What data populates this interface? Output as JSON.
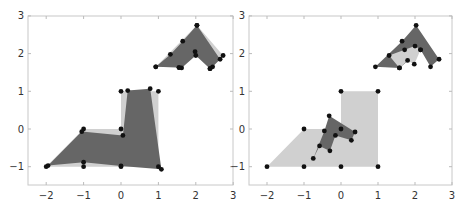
{
  "chart_data": [
    {
      "type": "polygon-scatter",
      "title": "",
      "xlabel": "",
      "ylabel": "",
      "xlim": [
        -2.5,
        3
      ],
      "ylim": [
        -1.5,
        3
      ],
      "xticks": [
        "-2",
        "-1",
        "0",
        "1",
        "2",
        "3"
      ],
      "yticks": [
        "-1",
        "0",
        "1",
        "2",
        "3"
      ],
      "grid": false,
      "series": [
        {
          "name": "original-L-shape",
          "fill": "#d0d0d0",
          "points": [
            [
              -2,
              -1
            ],
            [
              -1,
              0
            ],
            [
              0,
              0
            ],
            [
              0,
              1
            ],
            [
              1,
              1
            ],
            [
              1,
              -1
            ],
            [
              0,
              -1
            ],
            [
              -1,
              -1
            ]
          ]
        },
        {
          "name": "transformed-L-shape",
          "fill": "#666666",
          "points": [
            [
              -1.95,
              -0.97
            ],
            [
              -1.05,
              -0.07
            ],
            [
              0.05,
              -0.17
            ],
            [
              0.18,
              1.02
            ],
            [
              0.78,
              1.07
            ],
            [
              1.08,
              -1.07
            ],
            [
              0.0,
              -0.98
            ],
            [
              -1.0,
              -0.88
            ]
          ]
        },
        {
          "name": "original-chevron",
          "fill": "#d0d0d0",
          "points": [
            [
              0.93,
              1.65
            ],
            [
              2.03,
              2.75
            ],
            [
              2.73,
              1.95
            ],
            [
              2.38,
              1.6
            ],
            [
              1.98,
              2.05
            ],
            [
              1.55,
              1.63
            ]
          ]
        },
        {
          "name": "transformed-chevron",
          "fill": "#666666",
          "points": [
            [
              0.93,
              1.65
            ],
            [
              1.32,
              1.98
            ],
            [
              1.65,
              2.33
            ],
            [
              2.03,
              2.75
            ],
            [
              2.65,
              1.85
            ],
            [
              2.45,
              1.65
            ],
            [
              2.38,
              1.6
            ],
            [
              2.0,
              1.95
            ],
            [
              1.62,
              1.62
            ],
            [
              1.55,
              1.63
            ]
          ]
        }
      ]
    },
    {
      "type": "polygon-scatter",
      "title": "",
      "xlabel": "",
      "ylabel": "",
      "xlim": [
        -2.5,
        3
      ],
      "ylim": [
        -1.5,
        3
      ],
      "xticks": [
        "-2",
        "-1",
        "0",
        "1",
        "2",
        "3"
      ],
      "yticks": [
        "-1",
        "0",
        "1",
        "2",
        "3"
      ],
      "grid": false,
      "series": [
        {
          "name": "original-L-shape",
          "fill": "#d0d0d0",
          "points": [
            [
              -2,
              -1
            ],
            [
              -1,
              0
            ],
            [
              0,
              0
            ],
            [
              0,
              1
            ],
            [
              1,
              1
            ],
            [
              1,
              -1
            ],
            [
              0,
              -1
            ],
            [
              -1,
              -1
            ]
          ]
        },
        {
          "name": "transformed-L-shape",
          "fill": "#666666",
          "points": [
            [
              -0.75,
              -0.78
            ],
            [
              -0.45,
              -0.05
            ],
            [
              -0.32,
              0.35
            ],
            [
              0.38,
              -0.08
            ],
            [
              0.28,
              -0.3
            ],
            [
              -0.15,
              -0.17
            ],
            [
              -0.3,
              -0.58
            ],
            [
              -0.58,
              -0.45
            ]
          ]
        },
        {
          "name": "outer-chevron",
          "fill": "#666666",
          "points": [
            [
              0.93,
              1.65
            ],
            [
              1.65,
              2.33
            ],
            [
              2.03,
              2.75
            ],
            [
              2.65,
              1.85
            ],
            [
              2.42,
              1.65
            ],
            [
              2.15,
              2.1
            ],
            [
              1.58,
              1.62
            ]
          ]
        },
        {
          "name": "inner-chevron",
          "fill": "#d0d0d0",
          "points": [
            [
              1.3,
              1.95
            ],
            [
              1.72,
              2.1
            ],
            [
              2.0,
              2.2
            ],
            [
              2.15,
              2.1
            ],
            [
              1.98,
              1.72
            ],
            [
              1.8,
              1.82
            ],
            [
              1.58,
              1.62
            ]
          ]
        }
      ]
    }
  ],
  "panels": [
    {
      "xticks": [
        "-2",
        "-1",
        "0",
        "1",
        "2",
        "3"
      ],
      "yticks": [
        "3",
        "2",
        "1",
        "0",
        "-1"
      ]
    },
    {
      "xticks": [
        "-2",
        "-1",
        "0",
        "1",
        "2",
        "3"
      ],
      "yticks": [
        "3",
        "2",
        "1",
        "0",
        "-1"
      ]
    }
  ]
}
